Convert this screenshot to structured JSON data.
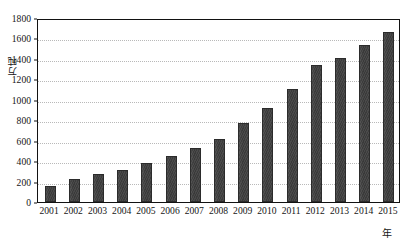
{
  "chart_data": {
    "type": "bar",
    "title": "",
    "subtitle": "",
    "xlabel": "年",
    "ylabel": "万吨",
    "categories": [
      "2001",
      "2002",
      "2003",
      "2004",
      "2005",
      "2006",
      "2007",
      "2008",
      "2009",
      "2010",
      "2011",
      "2012",
      "2013",
      "2014",
      "2015"
    ],
    "values": [
      160,
      222,
      270,
      315,
      383,
      455,
      533,
      612,
      772,
      920,
      1108,
      1337,
      1413,
      1537,
      1668
    ],
    "series": [
      {
        "name": "",
        "values": [
          160,
          222,
          270,
          315,
          383,
          455,
          533,
          612,
          772,
          920,
          1108,
          1337,
          1413,
          1537,
          1668
        ]
      }
    ],
    "ylim": [
      0,
      1800
    ],
    "y_ticks": [
      0,
      200,
      400,
      600,
      800,
      1000,
      1200,
      1400,
      1600,
      1800
    ],
    "y_tick_labels": [
      "0",
      "200",
      "400",
      "600",
      "800",
      "1000",
      "1200",
      "1400",
      "1600",
      "1800"
    ],
    "grid": true,
    "grid_axis": "y",
    "legend": false,
    "legend_position": "none",
    "bar_color": "#434343",
    "grid_color": "#b9b9b9",
    "axis_color": "#121212"
  },
  "axes": {
    "y_title": "万吨",
    "x_title": "年"
  }
}
